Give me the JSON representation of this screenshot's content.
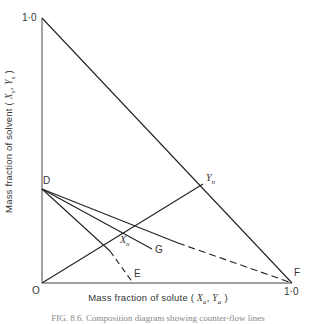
{
  "figure": {
    "y_axis_label_prefix": "Mass fraction of solvent (",
    "y_axis_label_vars": "X",
    "y_axis_label_sub1": "s",
    "y_axis_label_vars2": "Y",
    "y_axis_label_sub2": "s",
    "y_axis_label_suffix": ")",
    "x_axis_label_prefix": "Mass fraction of solute (",
    "x_axis_label_vars": "X",
    "x_axis_label_sub1": "a",
    "x_axis_label_vars2": "Y",
    "x_axis_label_sub2": "a",
    "x_axis_label_suffix": ")",
    "y_max_tick": "1·0",
    "x_max_tick": "1·0",
    "origin_label": "O",
    "caption": "FIG. 8.6.   Composition diagram showing counter-flow lines"
  },
  "points": {
    "D": "D",
    "E": "E",
    "F": "F",
    "G": "G",
    "Xn": "X",
    "Xn_sub": "n",
    "Yn": "Y",
    "Yn_sub": "n"
  },
  "colors": {
    "line": "#222222",
    "axis": "#444444"
  }
}
